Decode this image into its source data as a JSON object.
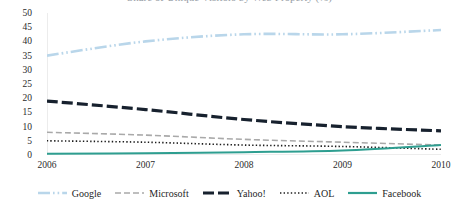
{
  "chart_data": {
    "type": "line",
    "title": "Share of Unique Visitors by Web Property (%)",
    "subtitle": "",
    "xlabel": "",
    "ylabel": "",
    "x": [
      "2006",
      "2007",
      "2008",
      "2009",
      "2010"
    ],
    "categories": [
      "2006",
      "2007",
      "2008",
      "2009",
      "2010"
    ],
    "ylim": [
      0,
      50
    ],
    "yticks": [
      "0",
      "5",
      "10",
      "15",
      "20",
      "25",
      "30",
      "35",
      "40",
      "45",
      "50"
    ],
    "grid": false,
    "legend_position": "bottom",
    "series": [
      {
        "name": "Google",
        "color": "#b9d6ea",
        "style": "dash-dot-dot",
        "width": 2.6,
        "values": [
          35.0,
          40.0,
          42.5,
          42.5,
          44.0
        ]
      },
      {
        "name": "Microsoft",
        "color": "#a9a9a9",
        "style": "dashed",
        "width": 1.6,
        "values": [
          8.0,
          7.0,
          5.5,
          4.5,
          3.5
        ]
      },
      {
        "name": "Yahoo!",
        "color": "#17212e",
        "style": "long-dash",
        "width": 3.2,
        "values": [
          19.0,
          16.0,
          12.5,
          10.0,
          8.5
        ]
      },
      {
        "name": "AOL",
        "color": "#1c1c1c",
        "style": "dotted",
        "width": 1.6,
        "values": [
          5.0,
          4.5,
          3.5,
          3.0,
          2.0
        ]
      },
      {
        "name": "Facebook",
        "color": "#2e9e90",
        "style": "solid",
        "width": 2.0,
        "values": [
          0.4,
          0.6,
          1.0,
          1.6,
          3.5
        ]
      }
    ]
  },
  "axes": {
    "y_tick_labels": [
      "50",
      "45",
      "40",
      "35",
      "30",
      "25",
      "20",
      "15",
      "10",
      "5",
      "0"
    ],
    "x_tick_labels": [
      "2006",
      "2007",
      "2008",
      "2009",
      "2010"
    ]
  },
  "legend": {
    "items": [
      {
        "label": "Google",
        "color": "#b9d6ea",
        "style": "dash-dot-dot"
      },
      {
        "label": "Microsoft",
        "color": "#a9a9a9",
        "style": "dashed"
      },
      {
        "label": "Yahoo!",
        "color": "#17212e",
        "style": "long-dash"
      },
      {
        "label": "AOL",
        "color": "#1c1c1c",
        "style": "dotted"
      },
      {
        "label": "Facebook",
        "color": "#2e9e90",
        "style": "solid"
      }
    ]
  },
  "colors": {
    "google": "#b9d6ea",
    "microsoft": "#a9a9a9",
    "yahoo": "#17212e",
    "aol": "#1c1c1c",
    "facebook": "#2e9e90",
    "axis": "#d9d9d9",
    "text": "#2b2b2b",
    "background": "#ffffff"
  }
}
